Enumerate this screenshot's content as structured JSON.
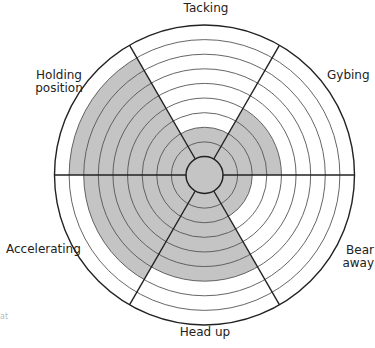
{
  "chart_data": {
    "type": "radar-wheel",
    "title": "",
    "scale": {
      "min": 0,
      "max": 9,
      "rings": 9
    },
    "categories": [
      "Tacking",
      "Gybing",
      "Bear away",
      "Head up",
      "Accelerating",
      "Holding position"
    ],
    "values": [
      2,
      4,
      2,
      6,
      7,
      8
    ],
    "sector_angles_deg": [
      90,
      30,
      -30,
      -90,
      210,
      150
    ],
    "fill_color": "#c4c4c4",
    "line_color": "#222222",
    "ring_color": "#555555",
    "grid": true,
    "legend": null
  },
  "labels": {
    "tacking": "Tacking",
    "gybing": "Gybing",
    "bear_away_1": "Bear",
    "bear_away_2": "away",
    "head_up": "Head up",
    "accelerating": "Accelerating",
    "holding_1": "Holding",
    "holding_2": "position"
  },
  "fragment": "at"
}
